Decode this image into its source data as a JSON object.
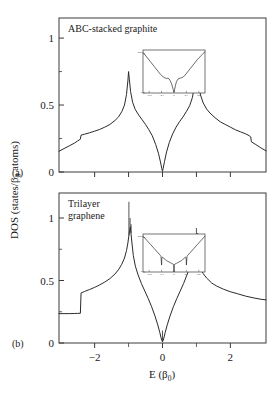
{
  "figure": {
    "y_axis_label": "DOS (states/β",
    "y_axis_label_sub": "0",
    "y_axis_label_tail": " atoms)",
    "x_axis_label": "E (β",
    "x_axis_label_sub": "0",
    "x_axis_label_tail": ")",
    "line_color": "#2a2a2a",
    "frame_color": "#3a3a3a",
    "background": "#ffffff"
  },
  "panels": [
    {
      "id": "a",
      "label": "(a)",
      "title": "ABC-stacked graphite",
      "title_line2": "",
      "y_ticks": [
        "0",
        "0.5",
        "1"
      ],
      "y_tick_values": [
        0,
        0.5,
        1
      ],
      "x_ticks": [
        "",
        "",
        "",
        "",
        ""
      ],
      "x_tick_values": [
        -2,
        -1,
        0,
        1,
        2
      ],
      "inset": {
        "x_ticks": [
          "-0.2",
          "-0.1",
          "0",
          "0.1",
          "0.2"
        ],
        "y_ticks": [
          "0.05",
          "0",
          ""
        ]
      }
    },
    {
      "id": "b",
      "label": "(b)",
      "title": "Trilayer",
      "title_line2": "graphene",
      "y_ticks": [
        "0",
        "0.5",
        "1"
      ],
      "y_tick_values": [
        0,
        0.5,
        1
      ],
      "x_ticks": [
        "-2",
        "0",
        "2"
      ],
      "x_tick_values": [
        -2,
        0,
        2
      ],
      "x_minor_values": [
        -1,
        1
      ],
      "inset": {
        "x_ticks": [
          "-0.2",
          "-0.1",
          "0",
          "0.1",
          "0.2"
        ],
        "y_ticks": [
          "0.05",
          "0",
          ""
        ]
      }
    }
  ],
  "chart_data": {
    "type": "line",
    "xlabel": "E (β0)",
    "ylabel": "DOS (states/β0 atoms)",
    "xlim": [
      -3.05,
      3.05
    ],
    "grid": false,
    "legend": "none",
    "subplots": [
      {
        "name": "ABC-stacked graphite",
        "panel": "a",
        "ylim": [
          0,
          1.15
        ],
        "y_ticks": [
          0,
          0.5,
          1
        ],
        "x_ticks": [
          -2,
          -1,
          0,
          1,
          2
        ],
        "annotations": [
          "Dirac-like minimum at E = 0 with DOS -> 0",
          "Van Hove singularity peak near E = -1 (height ~0.75)",
          "Van Hove singularity peak near E = +1 (height ~0.90)",
          "Band-edge step discontinuity near E = -2.4 (0.17 -> 0.28)",
          "Band-edge step discontinuity near E = +2.6 (0.26 -> 0.17)"
        ],
        "x": [
          -3.05,
          -2.9,
          -2.75,
          -2.6,
          -2.5,
          -2.42,
          -2.4,
          -2.3,
          -2.15,
          -2.0,
          -1.85,
          -1.7,
          -1.55,
          -1.4,
          -1.3,
          -1.2,
          -1.12,
          -1.06,
          -1.02,
          -1.0,
          -0.98,
          -0.94,
          -0.88,
          -0.8,
          -0.7,
          -0.6,
          -0.5,
          -0.4,
          -0.3,
          -0.2,
          -0.12,
          -0.06,
          -0.02,
          0,
          0.02,
          0.06,
          0.12,
          0.2,
          0.3,
          0.4,
          0.5,
          0.6,
          0.7,
          0.8,
          0.88,
          0.94,
          0.98,
          1.0,
          1.02,
          1.06,
          1.12,
          1.2,
          1.3,
          1.4,
          1.55,
          1.7,
          1.85,
          2.0,
          2.15,
          2.3,
          2.45,
          2.55,
          2.6,
          2.62,
          2.75,
          2.9,
          3.05
        ],
        "y": [
          0.155,
          0.175,
          0.195,
          0.215,
          0.232,
          0.245,
          0.275,
          0.282,
          0.293,
          0.305,
          0.318,
          0.335,
          0.355,
          0.385,
          0.41,
          0.45,
          0.5,
          0.58,
          0.68,
          0.75,
          0.7,
          0.6,
          0.52,
          0.465,
          0.425,
          0.39,
          0.355,
          0.315,
          0.27,
          0.205,
          0.14,
          0.075,
          0.025,
          0.005,
          0.028,
          0.08,
          0.15,
          0.22,
          0.285,
          0.335,
          0.375,
          0.41,
          0.45,
          0.495,
          0.555,
          0.64,
          0.78,
          0.9,
          0.8,
          0.66,
          0.575,
          0.515,
          0.47,
          0.44,
          0.405,
          0.375,
          0.355,
          0.335,
          0.315,
          0.3,
          0.285,
          0.272,
          0.262,
          0.225,
          0.205,
          0.18,
          0.158
        ]
      },
      {
        "name": "Trilayer graphene",
        "panel": "b",
        "ylim": [
          0,
          1.2
        ],
        "y_ticks": [
          0,
          0.5,
          1
        ],
        "x_ticks": [
          -2,
          0,
          2
        ],
        "annotations": [
          "Sharp step at E = -2.4 from 0.235 to 0.40",
          "Triple van Hove spike cluster near E = -0.95 (max ~1.13)",
          "Triple van Hove spike cluster near E = +0.98 (max ~0.92)",
          "Parabolic-like minimum at E = 0 with narrow spike at zero energy"
        ],
        "x": [
          -3.05,
          -2.9,
          -2.75,
          -2.6,
          -2.5,
          -2.42,
          -2.4,
          -2.3,
          -2.15,
          -2.0,
          -1.85,
          -1.7,
          -1.55,
          -1.4,
          -1.3,
          -1.2,
          -1.12,
          -1.06,
          -1.02,
          -0.99,
          -0.97,
          -0.95,
          -0.93,
          -0.9,
          -0.86,
          -0.8,
          -0.72,
          -0.62,
          -0.52,
          -0.42,
          -0.32,
          -0.22,
          -0.14,
          -0.08,
          -0.04,
          -0.02,
          0,
          0.02,
          0.04,
          0.08,
          0.14,
          0.22,
          0.32,
          0.42,
          0.52,
          0.62,
          0.72,
          0.8,
          0.86,
          0.9,
          0.94,
          0.97,
          0.99,
          1.01,
          1.03,
          1.06,
          1.12,
          1.2,
          1.3,
          1.45,
          1.6,
          1.8,
          2.0,
          2.2,
          2.45,
          2.7,
          2.9,
          3.05
        ],
        "y": [
          0.235,
          0.235,
          0.235,
          0.236,
          0.237,
          0.238,
          0.4,
          0.412,
          0.428,
          0.445,
          0.465,
          0.488,
          0.515,
          0.552,
          0.585,
          0.63,
          0.68,
          0.74,
          0.8,
          0.86,
          0.9,
          0.93,
          0.88,
          0.8,
          0.7,
          0.615,
          0.545,
          0.475,
          0.415,
          0.355,
          0.29,
          0.215,
          0.145,
          0.085,
          0.04,
          0.02,
          0.01,
          0.02,
          0.04,
          0.085,
          0.145,
          0.215,
          0.29,
          0.355,
          0.415,
          0.475,
          0.545,
          0.6,
          0.655,
          0.7,
          0.76,
          0.8,
          0.84,
          0.8,
          0.74,
          0.67,
          0.6,
          0.555,
          0.52,
          0.48,
          0.455,
          0.43,
          0.41,
          0.395,
          0.375,
          0.36,
          0.35,
          0.345
        ]
      }
    ],
    "insets": [
      {
        "panel": "a",
        "xlim": [
          -0.25,
          0.25
        ],
        "ylim": [
          0,
          0.055
        ],
        "x_ticks": [
          -0.2,
          -0.1,
          0,
          0.1,
          0.2
        ],
        "y_ticks": [
          0,
          0.05
        ],
        "description": "V-shaped DOS near zero energy with small dip structure",
        "x": [
          -0.25,
          -0.22,
          -0.19,
          -0.16,
          -0.13,
          -0.11,
          -0.09,
          -0.075,
          -0.06,
          -0.05,
          -0.04,
          -0.03,
          -0.02,
          -0.012,
          -0.006,
          0,
          0.006,
          0.012,
          0.02,
          0.03,
          0.04,
          0.05,
          0.06,
          0.075,
          0.09,
          0.11,
          0.13,
          0.16,
          0.19,
          0.22,
          0.25
        ],
        "y": [
          0.052,
          0.046,
          0.04,
          0.034,
          0.028,
          0.024,
          0.021,
          0.0195,
          0.0185,
          0.019,
          0.018,
          0.0155,
          0.012,
          0.008,
          0.004,
          0.001,
          0.005,
          0.01,
          0.0145,
          0.0175,
          0.0185,
          0.019,
          0.0195,
          0.0205,
          0.023,
          0.027,
          0.031,
          0.037,
          0.043,
          0.048,
          0.053
        ]
      },
      {
        "panel": "b",
        "xlim": [
          -0.25,
          0.25
        ],
        "ylim": [
          0,
          0.055
        ],
        "x_ticks": [
          -0.2,
          -0.1,
          0,
          0.1,
          0.2
        ],
        "y_ticks": [
          0,
          0.05
        ],
        "description": "V-shaped DOS with downward spikes at +/-0.1 and a deep spike at zero",
        "x": [
          -0.25,
          -0.22,
          -0.19,
          -0.16,
          -0.135,
          -0.12,
          -0.11,
          -0.105,
          -0.1,
          -0.098,
          -0.095,
          -0.09,
          -0.08,
          -0.07,
          -0.06,
          -0.05,
          -0.04,
          -0.03,
          -0.02,
          -0.012,
          -0.006,
          -0.003,
          0,
          0.003,
          0.006,
          0.012,
          0.02,
          0.03,
          0.04,
          0.05,
          0.06,
          0.07,
          0.08,
          0.09,
          0.095,
          0.098,
          0.1,
          0.105,
          0.11,
          0.12,
          0.135,
          0.16,
          0.19,
          0.22,
          0.25
        ],
        "y": [
          0.052,
          0.046,
          0.04,
          0.034,
          0.029,
          0.026,
          0.024,
          0.0225,
          0.01,
          0.02,
          0.0215,
          0.021,
          0.0195,
          0.018,
          0.0165,
          0.0155,
          0.0145,
          0.0135,
          0.0125,
          0.012,
          0.0115,
          0.009,
          0.0,
          0.009,
          0.0115,
          0.012,
          0.0125,
          0.0135,
          0.0145,
          0.0155,
          0.0165,
          0.018,
          0.0195,
          0.021,
          0.0215,
          0.02,
          0.01,
          0.0225,
          0.024,
          0.026,
          0.029,
          0.034,
          0.04,
          0.046,
          0.052
        ]
      }
    ]
  }
}
